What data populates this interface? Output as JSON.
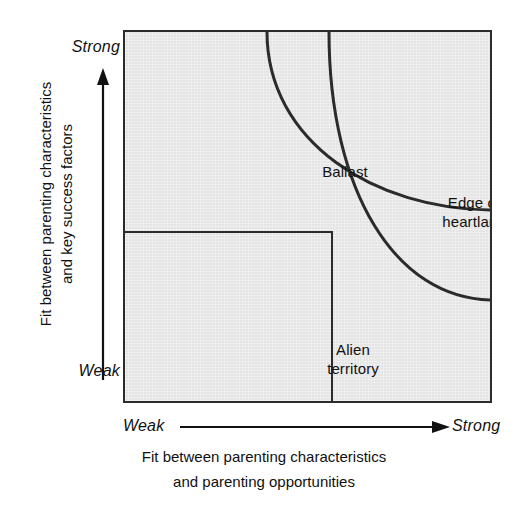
{
  "diagram": {
    "type": "2x2-strategy-matrix-with-arcs",
    "background_color": "#ffffff",
    "plot_fill_color": "#e4e4e4",
    "line_color": "#2b2b2b",
    "regions": [
      {
        "key": "ballast",
        "label": "Ballast"
      },
      {
        "key": "heartland",
        "label": "Heartland"
      },
      {
        "key": "edge",
        "label": "Edge of\nheartland"
      },
      {
        "key": "alien",
        "label": "Alien\nterritory"
      },
      {
        "key": "valuetrap",
        "label": "Value trap"
      }
    ],
    "y_axis": {
      "low_label": "Weak",
      "high_label": "Strong",
      "caption": "Fit between parenting characteristics\nand key success factors",
      "arrow_direction": "up",
      "arrow_icon": "arrow-up-icon"
    },
    "x_axis": {
      "low_label": "Weak",
      "high_label": "Strong",
      "caption": "Fit between parenting characteristics\nand parenting opportunities",
      "arrow_direction": "right",
      "arrow_icon": "arrow-right-icon"
    }
  }
}
